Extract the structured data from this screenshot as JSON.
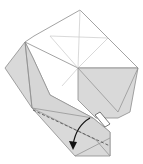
{
  "diagram": {
    "colors": {
      "paper_white": "#ffffff",
      "paper_gray": "#d9d9d9",
      "line": "#8c8c8c",
      "crease": "#c8c8c8",
      "dashed": "#555555",
      "arrow": "#111111"
    },
    "elements": [
      {
        "name": "square-top-white",
        "kind": "paper",
        "color": "white"
      },
      {
        "name": "gray-flap-right",
        "kind": "paper",
        "color": "gray"
      },
      {
        "name": "gray-strip-left",
        "kind": "paper",
        "color": "gray"
      },
      {
        "name": "valley-fold-line",
        "kind": "dashed-line"
      },
      {
        "name": "fold-arrow",
        "kind": "arrow",
        "direction": "down-left"
      }
    ]
  }
}
